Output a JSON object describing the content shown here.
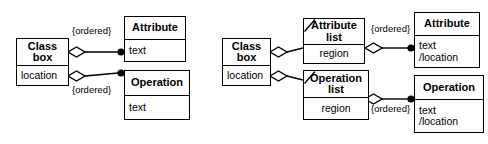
{
  "figure": {
    "type": "uml-class-diagram",
    "title": "",
    "background_color": "#ffffff",
    "line_color": "#000000",
    "text_color": "#000000"
  },
  "diagrams": [
    {
      "id": "left",
      "name": "direct-association-variant",
      "classes": [
        {
          "id": "left-class-box",
          "name": "Class\nbox",
          "attributes": "location",
          "derived_marker": false
        },
        {
          "id": "left-attribute",
          "name": "Attribute",
          "attributes": "text",
          "derived_marker": false
        },
        {
          "id": "left-operation",
          "name": "Operation",
          "attributes": "text",
          "derived_marker": false
        }
      ],
      "associations": [
        {
          "id": "left-assoc-attribute",
          "from": "left-class-box",
          "to": "left-attribute",
          "source_end": "hollow-diamond",
          "target_end": "filled-circle",
          "constraint": "{ordered}"
        },
        {
          "id": "left-assoc-operation",
          "from": "left-class-box",
          "to": "left-operation",
          "source_end": "hollow-diamond",
          "target_end": "filled-circle",
          "constraint": "{ordered}"
        }
      ]
    },
    {
      "id": "right",
      "name": "list-indirection-variant",
      "classes": [
        {
          "id": "right-class-box",
          "name": "Class\nbox",
          "attributes": "location",
          "derived_marker": false
        },
        {
          "id": "right-attribute-list",
          "name": "Attribute\nlist",
          "attributes": "region",
          "derived_marker": true
        },
        {
          "id": "right-operation-list",
          "name": "Operation\nlist",
          "attributes": "region",
          "derived_marker": true
        },
        {
          "id": "right-attribute",
          "name": "Attribute",
          "attributes": "text\n/location",
          "derived_marker": false
        },
        {
          "id": "right-operation",
          "name": "Operation",
          "attributes": "text\n/location",
          "derived_marker": false
        }
      ],
      "associations": [
        {
          "id": "right-assoc-classbox-attrlist",
          "from": "right-class-box",
          "to": "right-attribute-list",
          "source_end": "hollow-diamond",
          "target_end": "plain",
          "constraint": ""
        },
        {
          "id": "right-assoc-classbox-oplist",
          "from": "right-class-box",
          "to": "right-operation-list",
          "source_end": "hollow-diamond",
          "target_end": "plain",
          "constraint": ""
        },
        {
          "id": "right-assoc-attrlist-attribute",
          "from": "right-attribute-list",
          "to": "right-attribute",
          "source_end": "hollow-diamond",
          "target_end": "filled-circle",
          "constraint": "{ordered}"
        },
        {
          "id": "right-assoc-oplist-operation",
          "from": "right-operation-list",
          "to": "right-operation",
          "source_end": "hollow-diamond",
          "target_end": "filled-circle",
          "constraint": "{ordered}"
        }
      ]
    }
  ],
  "labels": {
    "ordered_left_top": "{ordered}",
    "ordered_left_bottom": "{ordered}",
    "ordered_right_top": "{ordered}",
    "ordered_right_bottom": "{ordered}"
  }
}
